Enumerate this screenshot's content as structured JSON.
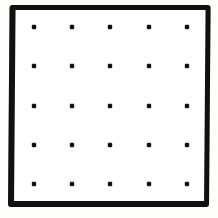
{
  "figure": {
    "title": "Dot lattice inside square frame",
    "kind": "geoboard-dot-grid",
    "caption": "",
    "canvas": {
      "width": 218,
      "height": 218,
      "background": "#fdfdfc"
    },
    "frame": {
      "name": "square-border",
      "shape": "square",
      "fill": "#ffffff",
      "stroke": "#111111",
      "left": 8,
      "top": 5,
      "width": 201,
      "height": 202,
      "border_top": 5,
      "border_right": 5,
      "border_bottom": 6,
      "border_left": 6
    },
    "grid": {
      "rows": 5,
      "columns": 5,
      "dot_count": 25,
      "dot_size": 4,
      "dot_color": "#0d0d0d",
      "column_x": [
        34,
        72,
        110,
        149,
        187
      ],
      "row_y": [
        27,
        66,
        106,
        145,
        184
      ],
      "spacing_x": 38,
      "spacing_y": 39
    },
    "dots": [
      {
        "row": 1,
        "col": 1,
        "x": 34,
        "y": 27
      },
      {
        "row": 1,
        "col": 2,
        "x": 72,
        "y": 27
      },
      {
        "row": 1,
        "col": 3,
        "x": 110,
        "y": 27
      },
      {
        "row": 1,
        "col": 4,
        "x": 149,
        "y": 27
      },
      {
        "row": 1,
        "col": 5,
        "x": 187,
        "y": 27
      },
      {
        "row": 2,
        "col": 1,
        "x": 34,
        "y": 66
      },
      {
        "row": 2,
        "col": 2,
        "x": 72,
        "y": 66
      },
      {
        "row": 2,
        "col": 3,
        "x": 110,
        "y": 66
      },
      {
        "row": 2,
        "col": 4,
        "x": 149,
        "y": 66
      },
      {
        "row": 2,
        "col": 5,
        "x": 187,
        "y": 66
      },
      {
        "row": 3,
        "col": 1,
        "x": 34,
        "y": 106
      },
      {
        "row": 3,
        "col": 2,
        "x": 72,
        "y": 106
      },
      {
        "row": 3,
        "col": 3,
        "x": 110,
        "y": 106
      },
      {
        "row": 3,
        "col": 4,
        "x": 149,
        "y": 106
      },
      {
        "row": 3,
        "col": 5,
        "x": 187,
        "y": 106
      },
      {
        "row": 4,
        "col": 1,
        "x": 34,
        "y": 145
      },
      {
        "row": 4,
        "col": 2,
        "x": 72,
        "y": 145
      },
      {
        "row": 4,
        "col": 3,
        "x": 110,
        "y": 145
      },
      {
        "row": 4,
        "col": 4,
        "x": 149,
        "y": 145
      },
      {
        "row": 4,
        "col": 5,
        "x": 187,
        "y": 145
      },
      {
        "row": 5,
        "col": 1,
        "x": 34,
        "y": 184
      },
      {
        "row": 5,
        "col": 2,
        "x": 72,
        "y": 184
      },
      {
        "row": 5,
        "col": 3,
        "x": 110,
        "y": 184
      },
      {
        "row": 5,
        "col": 4,
        "x": 149,
        "y": 184
      },
      {
        "row": 5,
        "col": 5,
        "x": 187,
        "y": 184
      }
    ]
  }
}
